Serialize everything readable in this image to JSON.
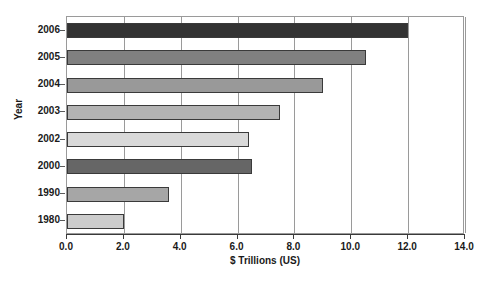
{
  "chart_data": {
    "type": "bar",
    "orientation": "horizontal",
    "title": "",
    "xlabel": "$ Trillions (US)",
    "ylabel": "Year",
    "categories": [
      "2006",
      "2005",
      "2004",
      "2003",
      "2002",
      "2000",
      "1990",
      "1980"
    ],
    "values": [
      12.0,
      10.5,
      9.0,
      7.5,
      6.4,
      6.5,
      3.6,
      2.0
    ],
    "bar_colors": [
      "#333333",
      "#808080",
      "#999999",
      "#b3b3b3",
      "#d9d9d9",
      "#666666",
      "#a6a6a6",
      "#cccccc"
    ],
    "xlim": [
      0.0,
      14.0
    ],
    "xticks": [
      "0.0",
      "2.0",
      "4.0",
      "6.0",
      "8.0",
      "10.0",
      "12.0",
      "14.0"
    ],
    "xtick_values": [
      0.0,
      2.0,
      4.0,
      6.0,
      8.0,
      10.0,
      12.0,
      14.0
    ],
    "grid": "vertical",
    "legend": "none"
  },
  "axes": {
    "x_title": "$ Trillions (US)",
    "y_title": "Year"
  }
}
